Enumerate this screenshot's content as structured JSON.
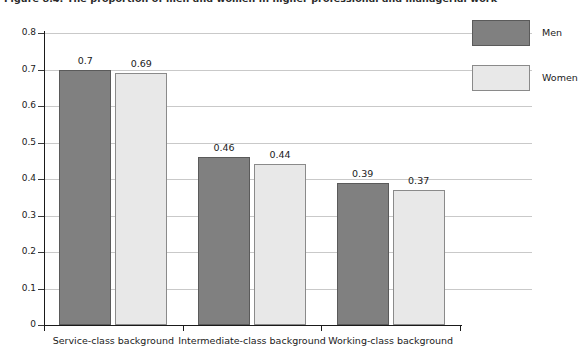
{
  "figure": {
    "title": "Figure 8.4: The proportion of men and women in higher professional and managerial work"
  },
  "chart_data": {
    "type": "bar",
    "title": "Figure 8.4: The proportion of men and women in higher professional and managerial work",
    "xlabel": "",
    "ylabel": "",
    "categories": [
      "Service-class background",
      "Intermediate-class background",
      "Working-class background"
    ],
    "series": [
      {
        "name": "Men",
        "color": "#808080",
        "values": [
          0.7,
          0.46,
          0.39
        ]
      },
      {
        "name": "Women",
        "color": "#e8e8e8",
        "values": [
          0.69,
          0.44,
          0.37
        ]
      }
    ],
    "value_labels": [
      [
        "0.7",
        "0.69"
      ],
      [
        "0.46",
        "0.44"
      ],
      [
        "0.39",
        "0.37"
      ]
    ],
    "ylim": [
      0,
      0.8
    ],
    "ytick_labels": [
      "0",
      "0.1",
      "0.2",
      "0.3",
      "0.4",
      "0.5",
      "0.6",
      "0.7",
      "0.8"
    ],
    "ytick_values": [
      0,
      0.1,
      0.2,
      0.3,
      0.4,
      0.5,
      0.6,
      0.7,
      0.8
    ],
    "grid": "horizontal",
    "legend_position": "top-right-outside",
    "legend_entries": [
      "Men",
      "Women"
    ]
  },
  "legend": {
    "items": [
      {
        "label": "Men"
      },
      {
        "label": "Women"
      }
    ]
  },
  "colors": {
    "men": "#808080",
    "women": "#e8e8e8",
    "axis": "#1a1a1a",
    "grid": "#c9c9c9"
  }
}
